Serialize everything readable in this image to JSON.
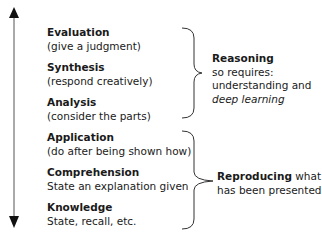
{
  "diagram": {
    "axis": {
      "direction": "bidirectional-vertical",
      "color": "#1a1a1a"
    },
    "levels": [
      {
        "title": "Evaluation",
        "description": "(give a judgment)"
      },
      {
        "title": "Synthesis",
        "description": "(respond creatively)"
      },
      {
        "title": "Analysis",
        "description": "(consider the parts)"
      },
      {
        "title": "Application",
        "description": "(do after being shown how)"
      },
      {
        "title": "Comprehension",
        "description": "State an explanation given"
      },
      {
        "title": "Knowledge",
        "description": "State, recall, etc."
      }
    ],
    "groups": [
      {
        "covers": [
          "Evaluation",
          "Synthesis",
          "Analysis"
        ],
        "label_bold": "Reasoning",
        "line2": "so requires:",
        "line3": "understanding and",
        "line4_italic": "deep learning"
      },
      {
        "covers": [
          "Application",
          "Comprehension",
          "Knowledge"
        ],
        "label_bold": "Reproducing",
        "label_rest": " what",
        "line2": "has been presented"
      }
    ]
  }
}
